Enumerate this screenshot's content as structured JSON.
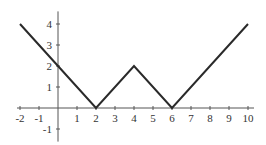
{
  "chart_data": {
    "type": "line",
    "title": "",
    "xlabel": "",
    "ylabel": "",
    "xlim": [
      -2,
      10
    ],
    "ylim": [
      -1.6,
      4.6
    ],
    "grid": false,
    "x_ticks": [
      -2,
      -1,
      1,
      2,
      3,
      4,
      5,
      6,
      7,
      8,
      9,
      10
    ],
    "x_tick_labels": [
      "-2",
      "-1",
      "1",
      "2",
      "3",
      "4",
      "5",
      "6",
      "7",
      "8",
      "9",
      "10"
    ],
    "y_ticks": [
      4,
      3,
      2,
      1,
      -1
    ],
    "y_tick_labels": [
      "4",
      "3",
      "2",
      "1",
      "-1"
    ],
    "series": [
      {
        "name": "f(x)",
        "color": "#2a2a2a",
        "x": [
          -2,
          0,
          2,
          4,
          6,
          10
        ],
        "y": [
          4,
          2,
          0,
          2,
          0,
          4
        ]
      }
    ]
  }
}
